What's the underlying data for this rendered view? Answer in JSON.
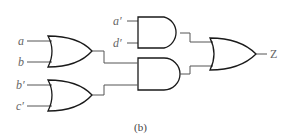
{
  "diagram": {
    "caption": "(b)",
    "inputs": {
      "a": "a",
      "b": "b",
      "b_prime": "b′",
      "c_prime": "c′",
      "a_prime": "a′",
      "d_prime": "d′"
    },
    "output": "Z",
    "gates": [
      {
        "id": "or1",
        "type": "OR",
        "inputs": [
          "a",
          "b"
        ]
      },
      {
        "id": "or2",
        "type": "OR",
        "inputs": [
          "b′",
          "c′"
        ]
      },
      {
        "id": "and1",
        "type": "AND",
        "inputs": [
          "a′",
          "d′"
        ]
      },
      {
        "id": "and2",
        "type": "AND",
        "inputs": [
          "or1",
          "or2"
        ]
      },
      {
        "id": "or3",
        "type": "OR",
        "inputs": [
          "and1",
          "and2"
        ],
        "output": "Z"
      }
    ]
  }
}
